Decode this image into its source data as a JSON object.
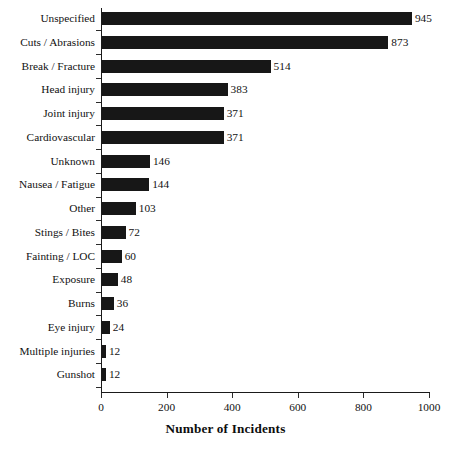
{
  "chart_data": {
    "type": "bar",
    "orientation": "horizontal",
    "title": "",
    "xlabel": "Number of Incidents",
    "ylabel": "",
    "xlim": [
      0,
      1000
    ],
    "xticks": [
      0,
      200,
      400,
      600,
      800,
      1000
    ],
    "xtick_labels": [
      "0",
      "200",
      "400",
      "600",
      "800",
      "1000"
    ],
    "grid": false,
    "legend": false,
    "bar_color": "#171717",
    "axis_color": "#1a1a1a",
    "categories": [
      "Unspecified",
      "Cuts / Abrasions",
      "Break / Fracture",
      "Head injury",
      "Joint injury",
      "Cardiovascular",
      "Unknown",
      "Nausea / Fatigue",
      "Other",
      "Stings / Bites",
      "Fainting / LOC",
      "Exposure",
      "Burns",
      "Eye injury",
      "Multiple injuries",
      "Gunshot"
    ],
    "values": [
      945,
      873,
      514,
      383,
      371,
      371,
      146,
      144,
      103,
      72,
      60,
      48,
      36,
      24,
      12,
      12
    ],
    "data_labels": [
      "945",
      "873",
      "514",
      "383",
      "371",
      "371",
      "146",
      "144",
      "103",
      "72",
      "60",
      "48",
      "36",
      "24",
      "12",
      "12"
    ]
  },
  "caption": {
    "partial_text": ""
  }
}
